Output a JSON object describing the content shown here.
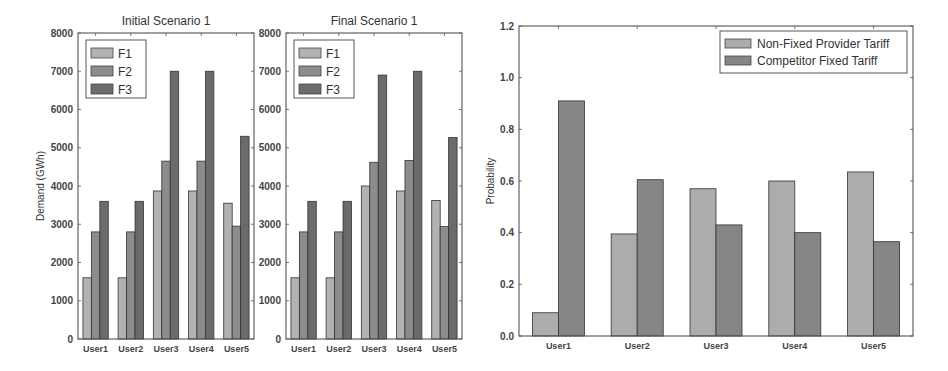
{
  "chart_data": [
    {
      "type": "bar",
      "title": "Initial Scenario 1",
      "xlabel": "",
      "ylabel": "Demand (GWh)",
      "ylim": [
        0,
        8000
      ],
      "yticks": [
        0,
        1000,
        2000,
        3000,
        4000,
        5000,
        6000,
        7000,
        8000
      ],
      "categories": [
        "User1",
        "User2",
        "User3",
        "User4",
        "User5"
      ],
      "legend_position": "top-left",
      "grid": false,
      "series": [
        {
          "name": "F1",
          "color": "#b2b2b2",
          "values": [
            1600,
            1600,
            3870,
            3870,
            3550
          ]
        },
        {
          "name": "F2",
          "color": "#8c8c8c",
          "values": [
            2800,
            2800,
            4650,
            4650,
            2950
          ]
        },
        {
          "name": "F3",
          "color": "#6b6b6b",
          "values": [
            3600,
            3600,
            7000,
            7000,
            5300
          ]
        }
      ]
    },
    {
      "type": "bar",
      "title": "Final Scenario 1",
      "xlabel": "",
      "ylabel": "",
      "ylim": [
        0,
        8000
      ],
      "yticks": [
        0,
        1000,
        2000,
        3000,
        4000,
        5000,
        6000,
        7000,
        8000
      ],
      "categories": [
        "User1",
        "User2",
        "User3",
        "User4",
        "User5"
      ],
      "legend_position": "top-left",
      "grid": false,
      "series": [
        {
          "name": "F1",
          "color": "#b2b2b2",
          "values": [
            1600,
            1600,
            4000,
            3870,
            3620
          ]
        },
        {
          "name": "F2",
          "color": "#8c8c8c",
          "values": [
            2800,
            2800,
            4620,
            4670,
            2940
          ]
        },
        {
          "name": "F3",
          "color": "#6b6b6b",
          "values": [
            3600,
            3600,
            6900,
            7000,
            5270
          ]
        }
      ]
    },
    {
      "type": "bar",
      "title": "",
      "xlabel": "",
      "ylabel": "Probability",
      "ylim": [
        0,
        1.2
      ],
      "yticks": [
        0.0,
        0.2,
        0.4,
        0.6,
        0.8,
        1.0,
        1.2
      ],
      "ytick_labels": [
        "0.0",
        "0.2",
        "0.4",
        "0.6",
        "0.8",
        "1.0",
        "1.2"
      ],
      "categories": [
        "User1",
        "User2",
        "User3",
        "User4",
        "User5"
      ],
      "legend_position": "top-right",
      "grid": false,
      "series": [
        {
          "name": "Non-Fixed Provider Tariff",
          "color": "#acacac",
          "values": [
            0.09,
            0.395,
            0.57,
            0.6,
            0.635
          ]
        },
        {
          "name": "Competitor Fixed Tariff",
          "color": "#868686",
          "values": [
            0.91,
            0.605,
            0.43,
            0.4,
            0.365
          ]
        }
      ]
    }
  ]
}
